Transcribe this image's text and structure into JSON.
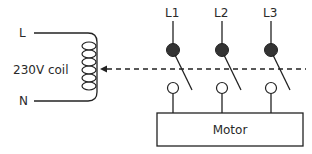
{
  "diagram": {
    "type": "contactor-wiring",
    "coil": {
      "line_label": "L",
      "neutral_label": "N",
      "coil_label": "230V coil"
    },
    "phases": [
      {
        "label": "L1"
      },
      {
        "label": "L2"
      },
      {
        "label": "L3"
      }
    ],
    "load": {
      "label": "Motor"
    },
    "colors": {
      "stroke": "#222222",
      "fixed_contact_fill": "#333333",
      "open_contact_fill": "#ffffff",
      "background": "#ffffff"
    }
  }
}
